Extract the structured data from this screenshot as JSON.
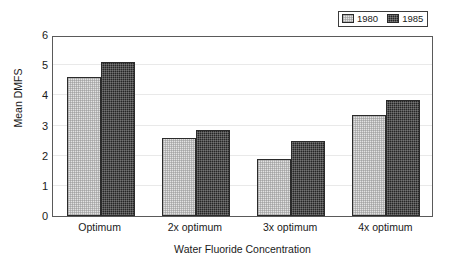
{
  "chart_data": {
    "type": "bar",
    "title": "",
    "subtitle": "",
    "xlabel": "Water Fluoride Concentration",
    "ylabel": "Mean DMFS",
    "categories": [
      "Optimum",
      "2x optimum",
      "3x optimum",
      "4x optimum"
    ],
    "series": [
      {
        "name": "1980",
        "values": [
          4.6,
          2.6,
          1.9,
          3.35
        ],
        "color": "#e2e2e2"
      },
      {
        "name": "1985",
        "values": [
          5.1,
          2.85,
          2.5,
          3.85
        ],
        "color": "#262626"
      }
    ],
    "ylim": [
      0,
      6
    ],
    "yticks": [
      0,
      1,
      2,
      3,
      4,
      5,
      6
    ],
    "ytick_labels": [
      "0",
      "1",
      "2",
      "3",
      "4",
      "5",
      "6"
    ],
    "grid": true,
    "grid_axis": "y",
    "legend_position": "top-right",
    "legend_entries": [
      "1980",
      "1985"
    ],
    "bar_border_color": "#2b2b2b",
    "axis_color": "#5a5a5a",
    "grid_color": "#e9e9e9",
    "background": "#ffffff"
  },
  "legend": {
    "entries": [
      {
        "label": "1980",
        "swatch": "light-stipple-swatch"
      },
      {
        "label": "1985",
        "swatch": "dark-stipple-swatch"
      }
    ]
  },
  "axes": {
    "y_title": "Mean DMFS",
    "x_title": "Water Fluoride Concentration",
    "y_ticks": [
      "6",
      "5",
      "4",
      "3",
      "2",
      "1",
      "0"
    ],
    "x_ticks": [
      "Optimum",
      "2x optimum",
      "3x optimum",
      "4x optimum"
    ]
  }
}
